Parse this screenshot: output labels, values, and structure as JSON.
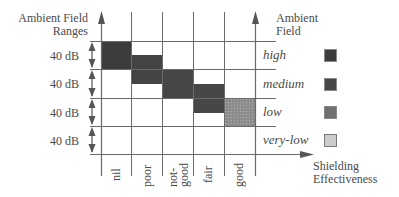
{
  "y_axis": {
    "title_line1": "Ambient Field",
    "title_line2": "Ranges",
    "ranges": [
      "40 dB",
      "40 dB",
      "40 dB",
      "40 dB"
    ]
  },
  "x_axis": {
    "title_line1": "Shielding",
    "title_line2": "Effectiveness",
    "categories": [
      "nil",
      "poor",
      "not-good",
      "fair",
      "good"
    ],
    "category_lines": [
      [
        "nil"
      ],
      [
        "poor"
      ],
      [
        "not-",
        "good"
      ],
      [
        "fair"
      ],
      [
        "good"
      ]
    ]
  },
  "legend": {
    "title_line1": "Ambient",
    "title_line2": "Field",
    "items": [
      {
        "label": "high",
        "color": "#3c3c3c"
      },
      {
        "label": "medium",
        "color": "#464646"
      },
      {
        "label": "low",
        "color": "#6f6f6f"
      },
      {
        "label": "very-low",
        "color": "#c9c9c9"
      }
    ]
  },
  "blocks": [
    {
      "column": "nil",
      "level": "high",
      "color": "#3c3c3c"
    },
    {
      "column": "poor",
      "level": "medium",
      "color": "#464646"
    },
    {
      "column": "not-good",
      "level": "medium",
      "color": "#464646"
    },
    {
      "column": "fair",
      "level": "low",
      "color": "#464646"
    },
    {
      "column": "good",
      "level": "very-low",
      "color": "#8a8a8a"
    }
  ],
  "colors": {
    "line": "#6a6a6a",
    "text": "#4a4a4a"
  }
}
